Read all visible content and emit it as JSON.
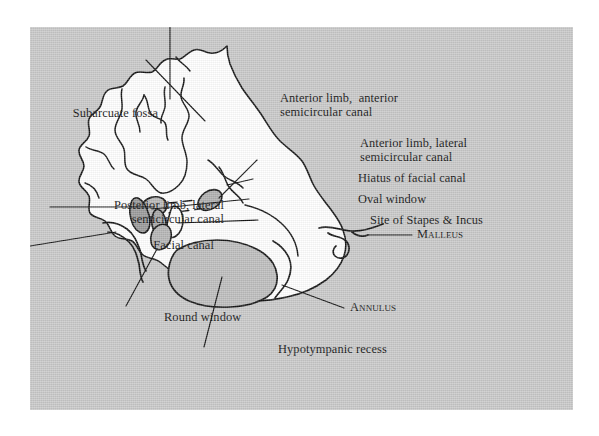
{
  "figure": {
    "type": "anatomical-line-drawing",
    "plate_background_color": "#c9c9c9",
    "ink_color": "#121212",
    "bone_fill_color": "#ffffff",
    "cavity_fill_color": "#bdbdbd",
    "highlight_color": "#d8bfc4"
  },
  "labels": {
    "subarcuate_fossa": "Subarcuate fossa",
    "anterior_limb_anterior_l1": "Anterior limb,  anterior",
    "anterior_limb_anterior_l2": "semicircular canal",
    "anterior_limb_lateral_l1": "Anterior limb, lateral",
    "anterior_limb_lateral_l2": "semicircular canal",
    "hiatus_of_facial_canal": "Hiatus of facial canal",
    "oval_window": "Oval window",
    "site_of_stapes_incus_prefix": "Site of ",
    "site_of_stapes_incus_caps": "Stapes & Incus",
    "posterior_limb_lateral_l1": "Posterior limb, lateral",
    "posterior_limb_lateral_l2": "semicircular canal",
    "facial_canal": "Facial canal",
    "malleus": "Malleus",
    "annulus": "Annulus",
    "round_window": "Round window",
    "hypotympanic_recess": "Hypotympanic recess"
  }
}
